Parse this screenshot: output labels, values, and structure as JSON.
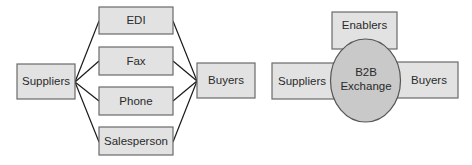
{
  "diagrams": [
    {
      "id": "traditional",
      "nodes": {
        "suppliers": {
          "label": "Suppliers"
        },
        "edi": {
          "label": "EDI"
        },
        "fax": {
          "label": "Fax"
        },
        "phone": {
          "label": "Phone"
        },
        "salesperson": {
          "label": "Salesperson"
        },
        "buyers": {
          "label": "Buyers"
        }
      },
      "edges": [
        [
          "Suppliers",
          "EDI"
        ],
        [
          "Suppliers",
          "Fax"
        ],
        [
          "Suppliers",
          "Phone"
        ],
        [
          "Suppliers",
          "Salesperson"
        ],
        [
          "EDI",
          "Buyers"
        ],
        [
          "Fax",
          "Buyers"
        ],
        [
          "Phone",
          "Buyers"
        ],
        [
          "Salesperson",
          "Buyers"
        ]
      ]
    },
    {
      "id": "b2b-exchange",
      "nodes": {
        "enablers": {
          "label": "Enablers"
        },
        "suppliers": {
          "label": "Suppliers"
        },
        "exchange": {
          "line1": "B2B",
          "line2": "Exchange"
        },
        "buyers": {
          "label": "Buyers"
        }
      }
    }
  ],
  "colors": {
    "box_fill": "#e2e2e2",
    "box_stroke": "#6a6a6a",
    "ellipse_fill": "#c9c9c9",
    "ellipse_stroke": "#555555",
    "line": "#1a1a1a",
    "text": "#2a2a2a"
  }
}
